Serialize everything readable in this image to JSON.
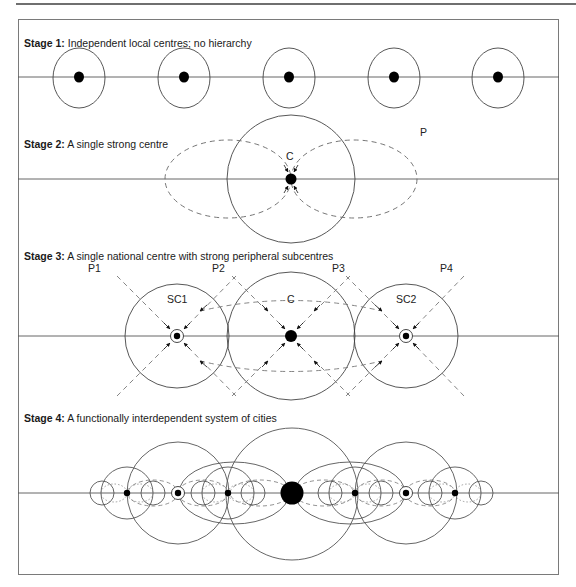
{
  "figure": {
    "stages": [
      {
        "id": 1,
        "title_bold": "Stage 1:",
        "title_text": " Independent local centres; no hierarchy"
      },
      {
        "id": 2,
        "title_bold": "Stage 2:",
        "title_text": " A single strong centre"
      },
      {
        "id": 3,
        "title_bold": "Stage 3:",
        "title_text": " A single national centre with strong peripheral subcentres"
      },
      {
        "id": 4,
        "title_bold": "Stage 4:",
        "title_text": " A functionally interdependent system of cities"
      }
    ],
    "stage2_labels": {
      "centre": "C",
      "periphery": "P"
    },
    "stage3_labels": {
      "peripheries": [
        "P1",
        "P2",
        "P3",
        "P4"
      ],
      "subcentre_1": "SC1",
      "centre": "C",
      "subcentre_2": "SC2"
    }
  }
}
